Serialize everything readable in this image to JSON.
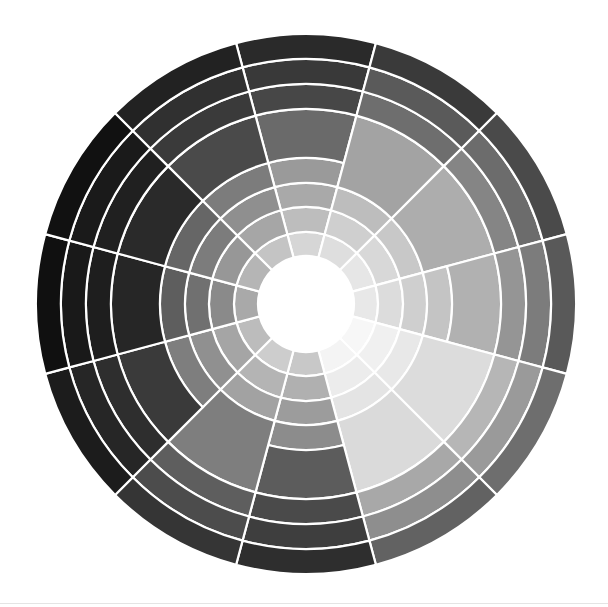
{
  "wheel": {
    "title": "Grayscale color wheel",
    "center": [
      306,
      304
    ],
    "outer_radius": 270,
    "hub_radius": 48,
    "hub_color": "#ffffff",
    "line_color": "#ffffff",
    "line_width": 2.2,
    "sector_count": 12,
    "start_angle_deg": -105,
    "sectors": [
      {
        "name": "sector-12-oclock",
        "bands": [
          [
            48,
            72,
            "#d6d6d6"
          ],
          [
            72,
            97,
            "#bdbdbd"
          ],
          [
            97,
            121,
            "#a9a9a9"
          ],
          [
            121,
            146,
            "#9a9a9a"
          ],
          [
            146,
            195,
            "#6a6a6a"
          ],
          [
            195,
            220,
            "#474747"
          ],
          [
            220,
            245,
            "#393939"
          ],
          [
            245,
            270,
            "#2a2a2a"
          ]
        ]
      },
      {
        "name": "sector-1-oclock",
        "bands": [
          [
            48,
            72,
            "#dedede"
          ],
          [
            72,
            97,
            "#cfcfcf"
          ],
          [
            97,
            121,
            "#bdbdbd"
          ],
          [
            121,
            195,
            "#a3a3a3"
          ],
          [
            195,
            220,
            "#6e6e6e"
          ],
          [
            220,
            245,
            "#5a5a5a"
          ],
          [
            245,
            270,
            "#3a3a3a"
          ]
        ]
      },
      {
        "name": "sector-2-oclock",
        "bands": [
          [
            48,
            72,
            "#e6e6e6"
          ],
          [
            72,
            97,
            "#d8d8d8"
          ],
          [
            97,
            121,
            "#c8c8c8"
          ],
          [
            121,
            195,
            "#adadad"
          ],
          [
            195,
            220,
            "#858585"
          ],
          [
            220,
            245,
            "#6c6c6c"
          ],
          [
            245,
            270,
            "#4a4a4a"
          ]
        ]
      },
      {
        "name": "sector-3-oclock",
        "bands": [
          [
            48,
            72,
            "#e8e8e8"
          ],
          [
            72,
            97,
            "#dcdcdc"
          ],
          [
            97,
            121,
            "#cfcfcf"
          ],
          [
            121,
            146,
            "#c4c4c4"
          ],
          [
            146,
            195,
            "#b1b1b1"
          ],
          [
            195,
            220,
            "#959595"
          ],
          [
            220,
            245,
            "#7c7c7c"
          ],
          [
            245,
            270,
            "#595959"
          ]
        ]
      },
      {
        "name": "sector-4-oclock",
        "bands": [
          [
            48,
            72,
            "#f7f7f7"
          ],
          [
            72,
            97,
            "#f0f0f0"
          ],
          [
            97,
            121,
            "#e8e8e8"
          ],
          [
            121,
            195,
            "#dcdcdc"
          ],
          [
            195,
            220,
            "#b6b6b6"
          ],
          [
            220,
            245,
            "#9a9a9a"
          ],
          [
            245,
            270,
            "#6e6e6e"
          ]
        ]
      },
      {
        "name": "sector-5-oclock",
        "bands": [
          [
            48,
            72,
            "#f4f4f4"
          ],
          [
            72,
            97,
            "#ececec"
          ],
          [
            97,
            121,
            "#e4e4e4"
          ],
          [
            121,
            195,
            "#dadada"
          ],
          [
            195,
            220,
            "#a8a8a8"
          ],
          [
            220,
            245,
            "#8e8e8e"
          ],
          [
            245,
            270,
            "#626262"
          ]
        ]
      },
      {
        "name": "sector-6-oclock",
        "bands": [
          [
            48,
            72,
            "#c8c8c8"
          ],
          [
            72,
            97,
            "#b0b0b0"
          ],
          [
            97,
            121,
            "#9c9c9c"
          ],
          [
            121,
            146,
            "#8c8c8c"
          ],
          [
            146,
            195,
            "#5c5c5c"
          ],
          [
            195,
            220,
            "#4a4a4a"
          ],
          [
            220,
            245,
            "#3e3e3e"
          ],
          [
            245,
            270,
            "#2e2e2e"
          ]
        ]
      },
      {
        "name": "sector-7-oclock",
        "bands": [
          [
            48,
            72,
            "#cdcdcd"
          ],
          [
            72,
            97,
            "#b4b4b4"
          ],
          [
            97,
            121,
            "#a2a2a2"
          ],
          [
            121,
            195,
            "#7e7e7e"
          ],
          [
            195,
            220,
            "#5e5e5e"
          ],
          [
            220,
            245,
            "#4c4c4c"
          ],
          [
            245,
            270,
            "#353535"
          ]
        ]
      },
      {
        "name": "sector-8-oclock",
        "bands": [
          [
            48,
            72,
            "#bcbcbc"
          ],
          [
            72,
            97,
            "#a5a5a5"
          ],
          [
            97,
            121,
            "#909090"
          ],
          [
            121,
            146,
            "#7e7e7e"
          ],
          [
            146,
            195,
            "#3a3a3a"
          ],
          [
            195,
            220,
            "#2e2e2e"
          ],
          [
            220,
            245,
            "#262626"
          ],
          [
            245,
            270,
            "#1c1c1c"
          ]
        ]
      },
      {
        "name": "sector-9-oclock",
        "bands": [
          [
            48,
            72,
            "#a9a9a9"
          ],
          [
            72,
            97,
            "#8a8a8a"
          ],
          [
            97,
            121,
            "#707070"
          ],
          [
            121,
            146,
            "#5e5e5e"
          ],
          [
            146,
            195,
            "#262626"
          ],
          [
            195,
            220,
            "#1e1e1e"
          ],
          [
            220,
            245,
            "#191919"
          ],
          [
            245,
            270,
            "#101010"
          ]
        ]
      },
      {
        "name": "sector-10-oclock",
        "bands": [
          [
            48,
            72,
            "#b5b5b5"
          ],
          [
            72,
            97,
            "#979797"
          ],
          [
            97,
            121,
            "#7c7c7c"
          ],
          [
            121,
            146,
            "#666666"
          ],
          [
            146,
            195,
            "#2a2a2a"
          ],
          [
            195,
            220,
            "#202020"
          ],
          [
            220,
            245,
            "#1a1a1a"
          ],
          [
            245,
            270,
            "#111111"
          ]
        ]
      },
      {
        "name": "sector-11-oclock",
        "bands": [
          [
            48,
            72,
            "#c4c4c4"
          ],
          [
            72,
            97,
            "#a6a6a6"
          ],
          [
            97,
            121,
            "#8f8f8f"
          ],
          [
            121,
            146,
            "#7c7c7c"
          ],
          [
            146,
            195,
            "#4a4a4a"
          ],
          [
            195,
            220,
            "#3a3a3a"
          ],
          [
            220,
            245,
            "#303030"
          ],
          [
            245,
            270,
            "#222222"
          ]
        ]
      }
    ]
  }
}
